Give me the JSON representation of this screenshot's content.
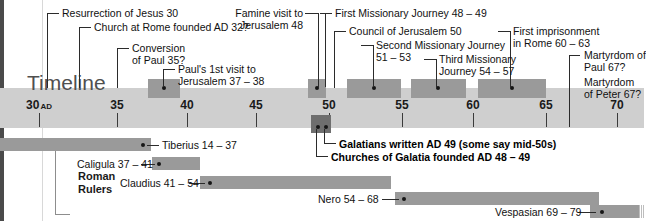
{
  "meta": {
    "title": "Timeline",
    "background": "#ffffff",
    "band_color": "#cfcfcf",
    "box_color": "#9a9a9a",
    "dark_box_color": "#6e6e6e",
    "rail_color": "#4a4a4a"
  },
  "axis": {
    "ticks": [
      {
        "label": "30",
        "suffix": "AD",
        "x": 39
      },
      {
        "label": "35",
        "suffix": "",
        "x": 117
      },
      {
        "label": "40",
        "suffix": "",
        "x": 187
      },
      {
        "label": "45",
        "suffix": "",
        "x": 256
      },
      {
        "label": "50",
        "suffix": "",
        "x": 329
      },
      {
        "label": "55",
        "suffix": "",
        "x": 402
      },
      {
        "label": "60",
        "suffix": "",
        "x": 473
      },
      {
        "label": "65",
        "suffix": "",
        "x": 546
      },
      {
        "label": "70",
        "suffix": "",
        "x": 617
      }
    ]
  },
  "events": [
    {
      "name": "resurrection-of-jesus",
      "text": "Resurrection of Jesus 30"
    },
    {
      "name": "church-at-rome-founded",
      "text": "Church at Rome founded AD 32?"
    },
    {
      "name": "conversion-of-paul",
      "text": "Conversion\nof Paul 35?"
    },
    {
      "name": "pauls-first-visit-to-jerusalem",
      "text": "Paul's 1st visit to\nJerusalem 37 – 38"
    },
    {
      "name": "famine-visit-to-jerusalem",
      "text": "Famine visit to\nJerusalem 48"
    },
    {
      "name": "first-missionary-journey",
      "text": "First Missionary Journey 48 – 49"
    },
    {
      "name": "council-of-jerusalem",
      "text": "Council of Jerusalem 50"
    },
    {
      "name": "second-missionary-journey",
      "text": "Second Missionary Journey\n51 – 53"
    },
    {
      "name": "third-missionary-journey",
      "text": "Third Missionary\nJourney 54 – 57"
    },
    {
      "name": "first-imprisonment-in-rome",
      "text": "First imprisonment\nin Rome 60 – 63"
    },
    {
      "name": "martyrdom-of-paul",
      "text": "Martyrdom of\nPaul 67?"
    },
    {
      "name": "martyrdom-of-peter",
      "text": "Martyrdom\nof Peter 67?"
    }
  ],
  "galatia": {
    "written": "Galatians written AD 49 (some say mid-50s)",
    "founded": "Churches of Galatia founded AD 48 – 49"
  },
  "rulers": {
    "section_title": "Roman\nRulers",
    "items": [
      {
        "name": "tiberius",
        "label": "Tiberius 14 – 37"
      },
      {
        "name": "caligula",
        "label": "Caligula 37 – 41"
      },
      {
        "name": "claudius",
        "label": "Claudius 41 – 54"
      },
      {
        "name": "nero",
        "label": "Nero 54 – 68"
      },
      {
        "name": "vespasian",
        "label": "Vespasian 69 – 79"
      }
    ]
  }
}
